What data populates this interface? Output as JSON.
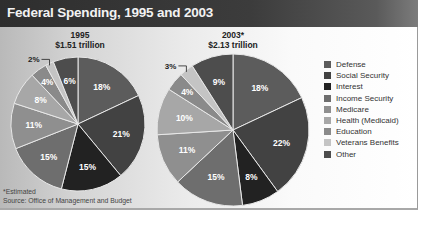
{
  "title": "Federal Spending, 1995 and 2003",
  "footnote": "*Estimated",
  "source": "Source:  Office of Management and Budget",
  "legend": [
    {
      "label": "Defense",
      "color": "#5c5c5c"
    },
    {
      "label": "Social Security",
      "color": "#424242"
    },
    {
      "label": "Interest",
      "color": "#222222"
    },
    {
      "label": "Income Security",
      "color": "#6e6e6e"
    },
    {
      "label": "Medicare",
      "color": "#8f8f8f"
    },
    {
      "label": "Health (Medicaid)",
      "color": "#a7a7a7"
    },
    {
      "label": "Education",
      "color": "#8a8a8a"
    },
    {
      "label": "Veterans Benefits",
      "color": "#c4c4c4"
    },
    {
      "label": "Other",
      "color": "#4d4d4d"
    }
  ],
  "pies": [
    {
      "year": "1995",
      "total": "$1.51 trillion"
    },
    {
      "year": "2003*",
      "total": "$2.13 trillion"
    }
  ],
  "chart_data": [
    {
      "type": "pie",
      "title": "1995",
      "subtitle": "$1.51 trillion",
      "categories": [
        "Defense",
        "Social Security",
        "Interest",
        "Income Security",
        "Medicare",
        "Health (Medicaid)",
        "Education",
        "Veterans Benefits",
        "Other"
      ],
      "values": [
        18,
        21,
        15,
        15,
        11,
        8,
        4,
        2,
        6
      ],
      "labels": [
        "18%",
        "21%",
        "15%",
        "15%",
        "11%",
        "8%",
        "4%",
        "2%",
        "6%"
      ],
      "unit": "percent",
      "start_angle": "12 o'clock, clockwise"
    },
    {
      "type": "pie",
      "title": "2003*",
      "subtitle": "$2.13 trillion",
      "categories": [
        "Defense",
        "Social Security",
        "Interest",
        "Income Security",
        "Medicare",
        "Health (Medicaid)",
        "Education",
        "Veterans Benefits",
        "Other"
      ],
      "values": [
        18,
        22,
        8,
        15,
        11,
        10,
        4,
        3,
        9
      ],
      "labels": [
        "18%",
        "22%",
        "8%",
        "15%",
        "11%",
        "10%",
        "4%",
        "3%",
        "9%"
      ],
      "unit": "percent",
      "start_angle": "12 o'clock, clockwise"
    }
  ]
}
